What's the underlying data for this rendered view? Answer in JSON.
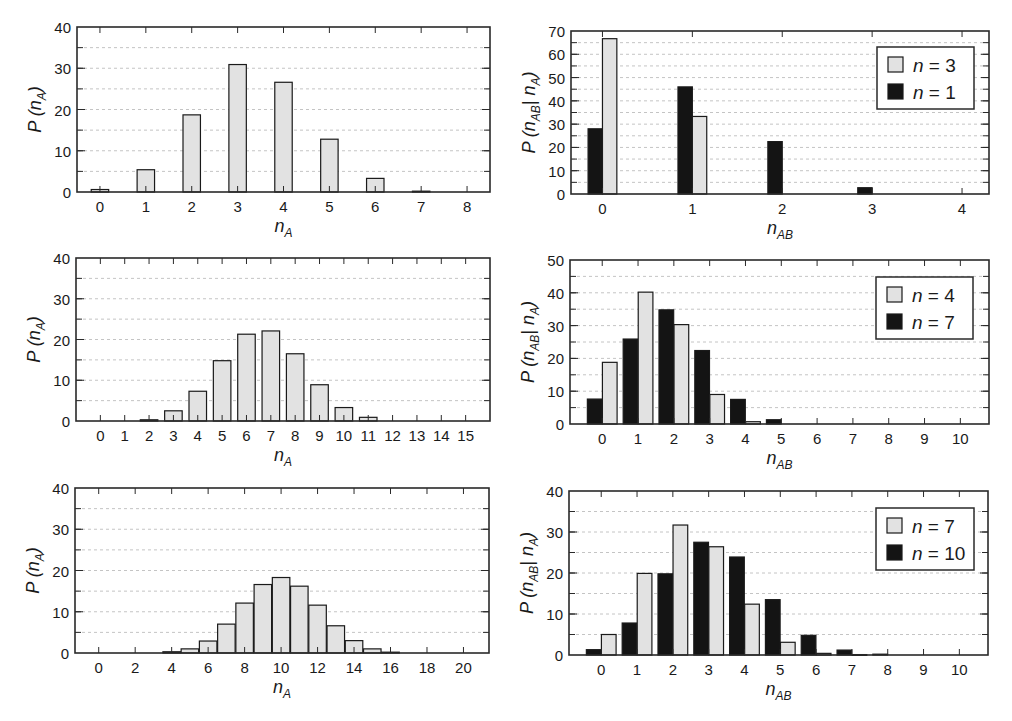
{
  "figure": {
    "background": "#ffffff",
    "colors": {
      "light_bar": "#e2e2e2",
      "dark_bar": "#141414",
      "frame": "#2a2a2a",
      "grid": "#bdbdbd"
    }
  },
  "chart_data": [
    {
      "id": "p1",
      "type": "bar",
      "frame": {
        "left": 77,
        "top": 27,
        "right": 490,
        "bottom": 192
      },
      "ylabel": "P (n_A)",
      "ylabel_main": "P (n",
      "ylabel_sub": "A",
      "ylabel_tail": ")",
      "xlabel": "n_A",
      "xlabel_main": "n",
      "xlabel_sub": "A",
      "ylim": [
        0,
        40
      ],
      "yticks": [
        0,
        10,
        20,
        30,
        40
      ],
      "minor_grid_step": 5,
      "xlim": [
        -0.5,
        8.5
      ],
      "xticks": [
        0,
        1,
        2,
        3,
        4,
        5,
        6,
        7,
        8
      ],
      "xtick_labels": [
        "0",
        "1",
        "2",
        "3",
        "4",
        "5",
        "6",
        "7",
        "8"
      ],
      "bar_width": 0.38,
      "series": [
        {
          "name": "P(n_A)",
          "color": "light",
          "offset": 0,
          "x": [
            0,
            1,
            2,
            3,
            4,
            5,
            6,
            7,
            8
          ],
          "values": [
            0.6,
            5.4,
            18.7,
            30.9,
            26.6,
            12.8,
            3.3,
            0.2,
            0.0
          ]
        }
      ],
      "legend": null
    },
    {
      "id": "p2",
      "type": "bar",
      "frame": {
        "left": 571,
        "top": 31,
        "right": 989,
        "bottom": 194
      },
      "ylabel": "P (n_AB | n_A)",
      "ylabel_main": "P (n",
      "ylabel_sub": "AB",
      "ylabel_mid": "| n",
      "ylabel_sub2": "A",
      "ylabel_tail": ")",
      "xlabel": "n_AB",
      "xlabel_main": "n",
      "xlabel_sub": "AB",
      "ylim": [
        0,
        70
      ],
      "yticks": [
        0,
        10,
        20,
        30,
        40,
        50,
        60,
        70
      ],
      "minor_grid_step": 5,
      "xlim": [
        -0.35,
        4.3
      ],
      "xticks": [
        0,
        1,
        2,
        3,
        4
      ],
      "xtick_labels": [
        "0",
        "1",
        "2",
        "3",
        "4"
      ],
      "bar_width": 0.16,
      "series": [
        {
          "name": "n = 1",
          "color": "dark",
          "offset": -0.08,
          "x": [
            0,
            1,
            2,
            3,
            4
          ],
          "values": [
            28.0,
            46.0,
            22.5,
            2.7,
            0.0
          ]
        },
        {
          "name": "n = 3",
          "color": "light",
          "offset": 0.08,
          "x": [
            0,
            1,
            2,
            3,
            4
          ],
          "values": [
            66.7,
            33.3,
            0.0,
            0.0,
            0.0
          ]
        }
      ],
      "legend": {
        "left": 877,
        "top": 47,
        "width": 97,
        "height": 62,
        "entries": [
          {
            "label": "n = 3",
            "n_label": "n",
            "value_label": "= 3",
            "color": "light"
          },
          {
            "label": "n = 1",
            "n_label": "n",
            "value_label": "= 1",
            "color": "dark"
          }
        ]
      }
    },
    {
      "id": "p3",
      "type": "bar",
      "frame": {
        "left": 76,
        "top": 258,
        "right": 490,
        "bottom": 421
      },
      "ylabel": "P (n_A)",
      "ylabel_main": "P (n",
      "ylabel_sub": "A",
      "ylabel_tail": ")",
      "xlabel": "n_A",
      "xlabel_main": "n",
      "xlabel_sub": "A",
      "ylim": [
        0,
        40
      ],
      "yticks": [
        0,
        10,
        20,
        30,
        40
      ],
      "minor_grid_step": 5,
      "xlim": [
        -1,
        16
      ],
      "xticks": [
        0,
        1,
        2,
        3,
        4,
        5,
        6,
        7,
        8,
        9,
        10,
        11,
        12,
        13,
        14,
        15
      ],
      "xtick_labels": [
        "0",
        "1",
        "2",
        "3",
        "4",
        "5",
        "6",
        "7",
        "8",
        "9",
        "10",
        "11",
        "12",
        "13",
        "14",
        "15"
      ],
      "bar_width": 0.72,
      "series": [
        {
          "name": "P(n_A)",
          "color": "light",
          "offset": 0,
          "x": [
            0,
            1,
            2,
            3,
            4,
            5,
            6,
            7,
            8,
            9,
            10,
            11,
            12,
            13,
            14,
            15
          ],
          "values": [
            0.0,
            0.0,
            0.3,
            2.5,
            7.3,
            14.8,
            21.3,
            22.1,
            16.5,
            8.9,
            3.3,
            0.9,
            0.0,
            0.0,
            0.0,
            0.0
          ]
        }
      ],
      "legend": null
    },
    {
      "id": "p4",
      "type": "bar",
      "frame": {
        "left": 570,
        "top": 260,
        "right": 989,
        "bottom": 424
      },
      "ylabel": "P (n_AB | n_A)",
      "ylabel_main": "P (n",
      "ylabel_sub": "AB",
      "ylabel_mid": "| n",
      "ylabel_sub2": "A",
      "ylabel_tail": ")",
      "xlabel": "n_AB",
      "xlabel_main": "n",
      "xlabel_sub": "AB",
      "ylim": [
        0,
        50
      ],
      "yticks": [
        0,
        10,
        20,
        30,
        40,
        50
      ],
      "minor_grid_step": 5,
      "xlim": [
        -0.9,
        10.8
      ],
      "xticks": [
        0,
        1,
        2,
        3,
        4,
        5,
        6,
        7,
        8,
        9,
        10
      ],
      "xtick_labels": [
        "0",
        "1",
        "2",
        "3",
        "4",
        "5",
        "6",
        "7",
        "8",
        "9",
        "10"
      ],
      "bar_width": 0.41,
      "series": [
        {
          "name": "n = 7",
          "color": "dark",
          "offset": -0.21,
          "x": [
            0,
            1,
            2,
            3,
            4,
            5,
            6,
            7,
            8,
            9,
            10
          ],
          "values": [
            7.6,
            25.9,
            34.8,
            22.4,
            7.5,
            1.3,
            0.0,
            0.0,
            0.0,
            0.0,
            0.0
          ]
        },
        {
          "name": "n = 4",
          "color": "light",
          "offset": 0.21,
          "x": [
            0,
            1,
            2,
            3,
            4,
            5,
            6,
            7,
            8,
            9,
            10
          ],
          "values": [
            18.8,
            40.2,
            30.3,
            9.0,
            0.7,
            0.0,
            0.0,
            0.0,
            0.0,
            0.0,
            0.0
          ]
        }
      ],
      "legend": {
        "left": 876,
        "top": 277,
        "width": 97,
        "height": 62,
        "entries": [
          {
            "label": "n = 4",
            "n_label": "n",
            "value_label": "= 4",
            "color": "light"
          },
          {
            "label": "n = 7",
            "n_label": "n",
            "value_label": "= 7",
            "color": "dark"
          }
        ]
      }
    },
    {
      "id": "p5",
      "type": "bar",
      "frame": {
        "left": 75,
        "top": 488,
        "right": 489,
        "bottom": 653
      },
      "ylabel": "P (n_A)",
      "ylabel_main": "P (n",
      "ylabel_sub": "A",
      "ylabel_tail": ")",
      "xlabel": "n_A",
      "xlabel_main": "n",
      "xlabel_sub": "A",
      "ylim": [
        0,
        40
      ],
      "yticks": [
        0,
        10,
        20,
        30,
        40
      ],
      "minor_grid_step": 5,
      "xlim": [
        -1.3,
        21.4
      ],
      "xticks": [
        0,
        2,
        4,
        6,
        8,
        10,
        12,
        14,
        16,
        18,
        20
      ],
      "xtick_labels": [
        "0",
        "2",
        "4",
        "6",
        "8",
        "10",
        "12",
        "14",
        "16",
        "18",
        "20"
      ],
      "bar_width": 0.96,
      "series": [
        {
          "name": "P(n_A)",
          "color": "light",
          "offset": 0,
          "x": [
            0,
            1,
            2,
            3,
            4,
            5,
            6,
            7,
            8,
            9,
            10,
            11,
            12,
            13,
            14,
            15,
            16,
            17,
            18,
            19,
            20
          ],
          "values": [
            0.0,
            0.0,
            0.0,
            0.0,
            0.3,
            1.0,
            2.9,
            7.0,
            12.1,
            16.6,
            18.3,
            16.2,
            11.6,
            6.6,
            3.0,
            1.0,
            0.2,
            0.0,
            0.0,
            0.0,
            0.0
          ]
        }
      ],
      "legend": null
    },
    {
      "id": "p6",
      "type": "bar",
      "frame": {
        "left": 569,
        "top": 491,
        "right": 988,
        "bottom": 655
      },
      "ylabel": "P (n_AB | n_A)",
      "ylabel_main": "P (n",
      "ylabel_sub": "AB",
      "ylabel_mid": "| n",
      "ylabel_sub2": "A",
      "ylabel_tail": ")",
      "xlabel": "n_AB",
      "xlabel_main": "n",
      "xlabel_sub": "AB",
      "ylim": [
        0,
        40
      ],
      "yticks": [
        0,
        10,
        20,
        30,
        40
      ],
      "minor_grid_step": 5,
      "xlim": [
        -0.9,
        10.8
      ],
      "xticks": [
        0,
        1,
        2,
        3,
        4,
        5,
        6,
        7,
        8,
        9,
        10
      ],
      "xtick_labels": [
        "0",
        "1",
        "2",
        "3",
        "4",
        "5",
        "6",
        "7",
        "8",
        "9",
        "10"
      ],
      "bar_width": 0.41,
      "series": [
        {
          "name": "n = 10",
          "color": "dark",
          "offset": -0.21,
          "x": [
            0,
            1,
            2,
            3,
            4,
            5,
            6,
            7,
            8,
            9,
            10
          ],
          "values": [
            1.3,
            7.8,
            19.8,
            27.5,
            23.9,
            13.5,
            4.8,
            1.2,
            0.2,
            0.0,
            0.0
          ]
        },
        {
          "name": "n = 7",
          "color": "light",
          "offset": 0.21,
          "x": [
            0,
            1,
            2,
            3,
            4,
            5,
            6,
            7,
            8,
            9,
            10
          ],
          "values": [
            5.0,
            19.9,
            31.7,
            26.4,
            12.4,
            3.1,
            0.4,
            0.1,
            0.0,
            0.0,
            0.0
          ]
        }
      ],
      "legend": {
        "left": 876,
        "top": 508,
        "width": 98,
        "height": 62,
        "entries": [
          {
            "label": "n = 7",
            "n_label": "n",
            "value_label": "= 7",
            "color": "light"
          },
          {
            "label": "n = 10",
            "n_label": "n",
            "value_label": "= 10",
            "color": "dark"
          }
        ]
      }
    }
  ]
}
